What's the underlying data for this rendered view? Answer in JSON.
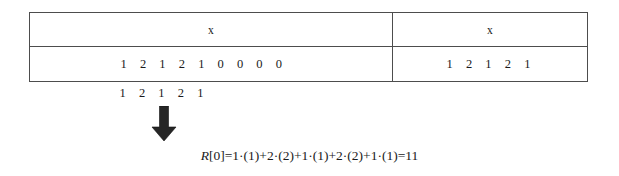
{
  "figure": {
    "table": {
      "columns": [
        {
          "header": "x",
          "name": "padded-array",
          "digits": [
            "1",
            "2",
            "1",
            "2",
            "1",
            "0",
            "0",
            "0",
            "0"
          ]
        },
        {
          "header": "x",
          "name": "original-array",
          "digits": [
            "1",
            "2",
            "1",
            "2",
            "1"
          ]
        }
      ]
    },
    "kernel": {
      "label": "kernel-digits",
      "digits": [
        "1",
        "2",
        "1",
        "2",
        "1"
      ]
    },
    "arrow": {
      "icon": "arrow-down-icon",
      "color": "#262626"
    },
    "result": {
      "lhs": "R",
      "index": "[0]",
      "equals": "=",
      "expression": "1·(1)+2·(2)+1·(1)+2·(2)+1·(1)",
      "result_equals": "=",
      "value": "11",
      "full_text": "R[0] = 1·(1) + 2·(2) + 1·(1) + 2·(2) + 1·(1) = 11"
    }
  },
  "colors": {
    "border": "#4d4d4d",
    "text": "#1a1a1a",
    "background": "#ffffff",
    "arrow": "#262626"
  }
}
